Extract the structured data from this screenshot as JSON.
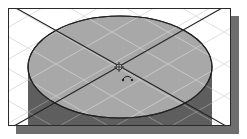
{
  "viewport": {
    "frame": {
      "x": 8,
      "y": 8,
      "width": 223,
      "height": 118
    },
    "shadow_offset": 8,
    "colors": {
      "background": "#ffffff",
      "frame_border": "#2a2a2a",
      "shadow": "#6e6e6e",
      "grid": "#d8d8d8",
      "ellipse_fill": "#a8a8a8",
      "cylinder_side": "#5e5e5e",
      "outline": "#222222"
    }
  },
  "model": {
    "shape": "cylinder",
    "top_ellipse": {
      "cx": 120,
      "cy": 67,
      "rx": 92,
      "ry": 51
    },
    "side_bottom_y": 126
  },
  "cursor": {
    "icon": "orbit-rotate-cursor",
    "center": {
      "x": 118,
      "y": 67
    }
  }
}
